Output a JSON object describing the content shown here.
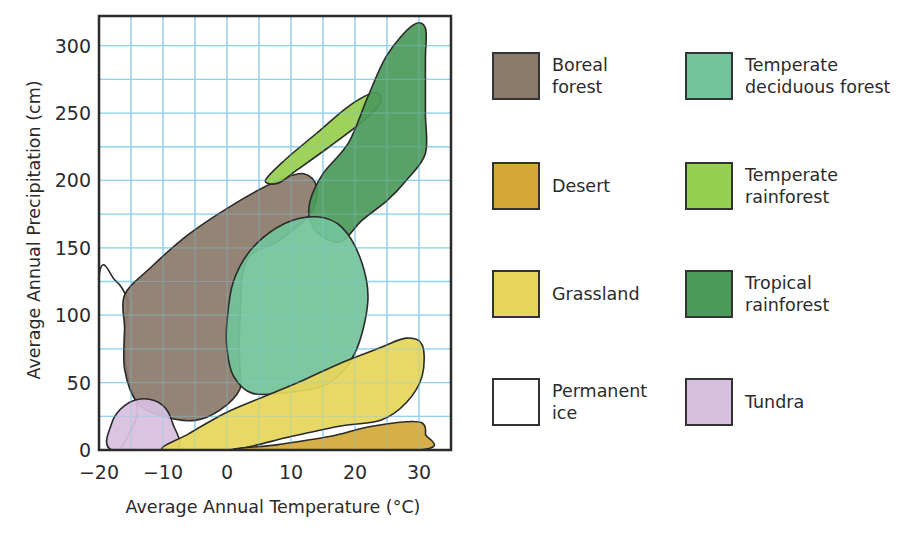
{
  "chart_data": {
    "type": "area",
    "subtype": "biome-climate-regions (Whittaker diagram)",
    "title": "",
    "xlabel": "Average Annual Temperature (°C)",
    "ylabel": "Average Annual Precipitation (cm)",
    "xlim": [
      -20,
      35
    ],
    "ylim": [
      0,
      322
    ],
    "x_ticks": [
      -20,
      -10,
      0,
      10,
      20,
      30
    ],
    "y_ticks": [
      0,
      50,
      100,
      150,
      200,
      250,
      300
    ],
    "x_tick_labels": [
      "−20",
      "−10",
      "0",
      "10",
      "20",
      "30"
    ],
    "y_tick_labels": [
      "0",
      "50",
      "100",
      "150",
      "200",
      "250",
      "300"
    ],
    "grid": {
      "on": true,
      "x_step": 5,
      "y_step": 25,
      "color": "#8fd3ec"
    },
    "legend_position": "right, two columns",
    "series": [
      {
        "name": "Boreal forest",
        "color": "#8c7b6a",
        "approx_range": {
          "temp": [
            -16,
            14
          ],
          "precip": [
            22,
            205
          ]
        },
        "outline": [
          [
            -16,
            115
          ],
          [
            -12,
            135
          ],
          [
            -6,
            160
          ],
          [
            2,
            185
          ],
          [
            8,
            200
          ],
          [
            12,
            205
          ],
          [
            14,
            195
          ],
          [
            13,
            175
          ],
          [
            8,
            155
          ],
          [
            3,
            140
          ],
          [
            2,
            95
          ],
          [
            2,
            60
          ],
          [
            2,
            45
          ],
          [
            -1,
            30
          ],
          [
            -5,
            22
          ],
          [
            -10,
            25
          ],
          [
            -14,
            35
          ],
          [
            -16,
            60
          ],
          [
            -16,
            90
          ]
        ]
      },
      {
        "name": "Temperate deciduous forest",
        "color": "#73c49a",
        "approx_range": {
          "temp": [
            0,
            22
          ],
          "precip": [
            40,
            173
          ]
        },
        "outline": [
          [
            0,
            95
          ],
          [
            1,
            125
          ],
          [
            4,
            150
          ],
          [
            9,
            168
          ],
          [
            14,
            173
          ],
          [
            18,
            165
          ],
          [
            21,
            140
          ],
          [
            22,
            110
          ],
          [
            20,
            72
          ],
          [
            16,
            50
          ],
          [
            10,
            43
          ],
          [
            4,
            42
          ],
          [
            1,
            55
          ],
          [
            0,
            75
          ]
        ]
      },
      {
        "name": "Desert",
        "color": "#d4a93a",
        "approx_range": {
          "temp": [
            2,
            31
          ],
          "precip": [
            0,
            22
          ]
        },
        "outline": [
          [
            2,
            0
          ],
          [
            8,
            4
          ],
          [
            16,
            10
          ],
          [
            22,
            17
          ],
          [
            28,
            21
          ],
          [
            30.5,
            20
          ],
          [
            31,
            12
          ],
          [
            30,
            0
          ]
        ]
      },
      {
        "name": "Temperate rainforest",
        "color": "#97cf4f",
        "approx_range": {
          "temp": [
            6,
            24
          ],
          "precip": [
            198,
            265
          ]
        },
        "outline": [
          [
            6,
            200
          ],
          [
            9,
            215
          ],
          [
            14,
            235
          ],
          [
            19,
            255
          ],
          [
            23,
            265
          ],
          [
            24,
            258
          ],
          [
            21,
            243
          ],
          [
            16,
            225
          ],
          [
            11,
            208
          ],
          [
            8,
            198
          ]
        ]
      },
      {
        "name": "Grassland",
        "color": "#e6d65b",
        "approx_range": {
          "temp": [
            -10,
            31
          ],
          "precip": [
            0,
            83
          ]
        },
        "outline": [
          [
            -10,
            0
          ],
          [
            -6,
            12
          ],
          [
            0,
            28
          ],
          [
            6,
            40
          ],
          [
            12,
            52
          ],
          [
            18,
            65
          ],
          [
            24,
            76
          ],
          [
            28,
            83
          ],
          [
            30.5,
            78
          ],
          [
            30.5,
            55
          ],
          [
            28,
            35
          ],
          [
            24,
            22
          ],
          [
            18,
            18
          ],
          [
            10,
            10
          ],
          [
            4,
            3
          ],
          [
            0,
            0
          ]
        ]
      },
      {
        "name": "Tropical rainforest",
        "color": "#4c9a5a",
        "approx_range": {
          "temp": [
            13,
            31
          ],
          "precip": [
            155,
            318
          ]
        },
        "outline": [
          [
            13,
            185
          ],
          [
            15,
            205
          ],
          [
            19,
            228
          ],
          [
            22,
            262
          ],
          [
            25,
            293
          ],
          [
            29,
            315
          ],
          [
            31,
            313
          ],
          [
            31,
            290
          ],
          [
            31,
            250
          ],
          [
            31,
            220
          ],
          [
            28,
            200
          ],
          [
            25,
            185
          ],
          [
            21,
            170
          ],
          [
            18,
            155
          ],
          [
            15,
            158
          ],
          [
            13,
            170
          ]
        ]
      },
      {
        "name": "Permanent ice",
        "color": "#ffffff",
        "approx_range": {
          "temp": [
            -20,
            -15
          ],
          "precip": [
            0,
            128
          ]
        },
        "outline": [
          [
            -20,
            128
          ],
          [
            -17.5,
            126
          ],
          [
            -15.5,
            110
          ],
          [
            -16,
            85
          ],
          [
            -15.5,
            55
          ],
          [
            -14,
            30
          ],
          [
            -15,
            15
          ],
          [
            -17,
            0
          ],
          [
            -20,
            0
          ]
        ]
      },
      {
        "name": "Tundra",
        "color": "#d7bfe0",
        "approx_range": {
          "temp": [
            -18,
            -8
          ],
          "precip": [
            0,
            38
          ]
        },
        "outline": [
          [
            -18,
            0
          ],
          [
            -18,
            20
          ],
          [
            -16,
            33
          ],
          [
            -13,
            38
          ],
          [
            -10,
            33
          ],
          [
            -8.5,
            20
          ],
          [
            -8,
            0
          ]
        ]
      }
    ]
  },
  "legend": {
    "items": [
      {
        "label": "Boreal\nforest",
        "color": "#8c7b6a"
      },
      {
        "label": "Temperate\ndeciduous forest",
        "color": "#73c49a"
      },
      {
        "label": "Desert",
        "color": "#d4a93a"
      },
      {
        "label": "Temperate\nrainforest",
        "color": "#97cf4f"
      },
      {
        "label": "Grassland",
        "color": "#e6d65b"
      },
      {
        "label": "Tropical\nrainforest",
        "color": "#4c9a5a"
      },
      {
        "label": "Permanent\nice",
        "color": "#ffffff"
      },
      {
        "label": "Tundra",
        "color": "#d7bfe0"
      }
    ]
  }
}
